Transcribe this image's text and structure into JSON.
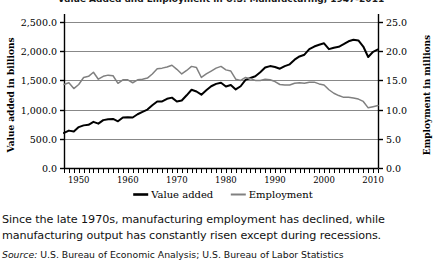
{
  "title": {
    "text": "Value Added and Employment in U.S. Manufacturing, 1947-2011"
  },
  "axes": {
    "left": {
      "label": "Value added in billions",
      "ticks": [
        "0.0",
        "500.0",
        "1,000.0",
        "1,500.0",
        "2,000.0",
        "2,500.0"
      ],
      "min": 0,
      "max": 2500
    },
    "right": {
      "label": "Employment in millions",
      "ticks": [
        "0.0",
        "5.0",
        "10.0",
        "15.0",
        "20.0",
        "25.0"
      ],
      "min": 0,
      "max": 25
    },
    "bottom": {
      "ticks": [
        "1950",
        "1960",
        "1970",
        "1980",
        "1990",
        "2000",
        "2010"
      ],
      "min": 1947,
      "max": 2011
    }
  },
  "legend": {
    "items": [
      {
        "label": "Value added",
        "color": "#000000"
      },
      {
        "label": "Employment",
        "color": "#808080"
      }
    ]
  },
  "caption": {
    "body": "Since the late 1970s, manufacturing employment has declined, while manufacturing output has constantly risen except during recessions.",
    "source_word": "Source:",
    "source_text": " U.S. Bureau of Economic Analysis; U.S. Bureau of Labor Statistics"
  },
  "chart_data": {
    "type": "line",
    "title": "Value Added and Employment in U.S. Manufacturing, 1947-2011",
    "xlabel": "",
    "ylabel": "Value added in billions",
    "y2label": "Employment in millions",
    "xlim": [
      1947,
      2011
    ],
    "ylim": [
      0,
      2500
    ],
    "y2lim": [
      0,
      25
    ],
    "grid": true,
    "legend_position": "bottom-center",
    "x": [
      1947,
      1948,
      1949,
      1950,
      1951,
      1952,
      1953,
      1954,
      1955,
      1956,
      1957,
      1958,
      1959,
      1960,
      1961,
      1962,
      1963,
      1964,
      1965,
      1966,
      1967,
      1968,
      1969,
      1970,
      1971,
      1972,
      1973,
      1974,
      1975,
      1976,
      1977,
      1978,
      1979,
      1980,
      1981,
      1982,
      1983,
      1984,
      1985,
      1986,
      1987,
      1988,
      1989,
      1990,
      1991,
      1992,
      1993,
      1994,
      1995,
      1996,
      1997,
      1998,
      1999,
      2000,
      2001,
      2002,
      2003,
      2004,
      2005,
      2006,
      2007,
      2008,
      2009,
      2010,
      2011
    ],
    "series": [
      {
        "name": "Value added",
        "axis": "left",
        "units": "billions of dollars",
        "color": "#000000",
        "values": [
          600,
          640,
          625,
          700,
          730,
          740,
          790,
          760,
          820,
          835,
          840,
          800,
          865,
          870,
          865,
          920,
          960,
          1000,
          1075,
          1140,
          1140,
          1185,
          1205,
          1140,
          1155,
          1245,
          1340,
          1310,
          1255,
          1330,
          1400,
          1440,
          1460,
          1395,
          1420,
          1345,
          1400,
          1510,
          1540,
          1570,
          1640,
          1720,
          1745,
          1730,
          1700,
          1745,
          1775,
          1855,
          1910,
          1940,
          2035,
          2080,
          2110,
          2135,
          2035,
          2060,
          2075,
          2120,
          2170,
          2195,
          2185,
          2080,
          1900,
          1990,
          2030
        ]
      },
      {
        "name": "Employment",
        "axis": "right",
        "units": "millions of workers",
        "color": "#808080",
        "values": [
          14.3,
          14.6,
          13.6,
          14.3,
          15.5,
          15.7,
          16.4,
          15.2,
          15.7,
          15.9,
          15.8,
          14.5,
          15.1,
          15.1,
          14.6,
          15.1,
          15.2,
          15.4,
          16.1,
          17.0,
          17.1,
          17.3,
          17.6,
          16.9,
          16.1,
          16.7,
          17.4,
          17.2,
          15.5,
          16.1,
          16.6,
          17.1,
          17.4,
          16.8,
          16.6,
          15.2,
          15.0,
          15.5,
          15.3,
          15.0,
          15.0,
          15.2,
          15.1,
          14.8,
          14.3,
          14.2,
          14.2,
          14.5,
          14.6,
          14.5,
          14.7,
          14.7,
          14.4,
          14.2,
          13.4,
          12.8,
          12.4,
          12.1,
          12.1,
          12.0,
          11.8,
          11.4,
          10.3,
          10.5,
          10.7
        ]
      }
    ],
    "annotations": []
  }
}
